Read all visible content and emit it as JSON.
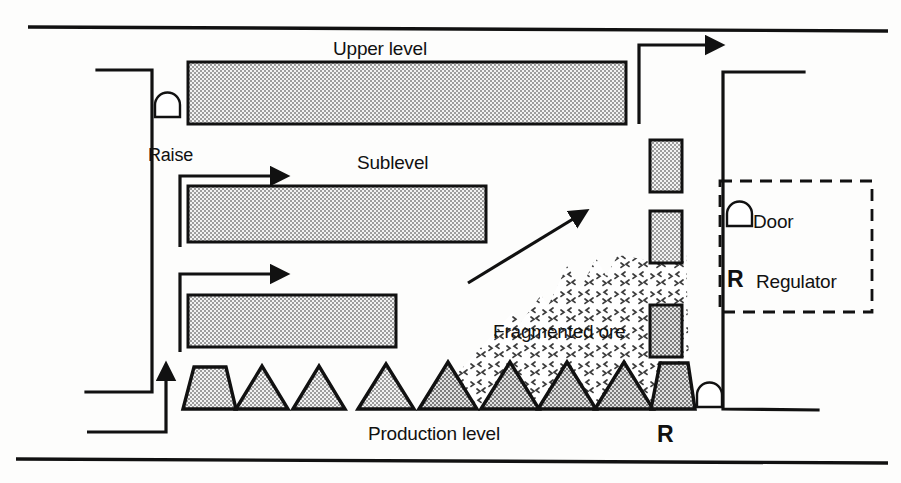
{
  "diagram": {
    "title_implicit": "Sublevel caving mine ventilation schematic",
    "labels": {
      "upper_level": "Upper level",
      "sublevel": "Sublevel",
      "raise": "Raise",
      "fragmented_ore": "Fragmented ore",
      "production_level": "Production level",
      "regulator_marker": "R"
    },
    "legend": {
      "items": [
        {
          "icon": "door-arch-icon",
          "label": "Door"
        },
        {
          "icon": "regulator-letter-icon",
          "glyph": "R",
          "label": "Regulator"
        }
      ]
    },
    "colors": {
      "line": "#111111",
      "hatch_fill": "#9a9a9a",
      "hatch_dark": "#7e7e7e",
      "stipple": "#4a4a4a",
      "background": "#fdfdfc"
    },
    "elements": {
      "drifts": [
        {
          "name": "upper-level-drift",
          "x": 188,
          "y": 62,
          "w": 438,
          "h": 62
        },
        {
          "name": "sublevel-drift-1",
          "x": 188,
          "y": 186,
          "w": 298,
          "h": 56
        },
        {
          "name": "sublevel-drift-2",
          "x": 188,
          "y": 295,
          "w": 208,
          "h": 52
        }
      ],
      "vertical_drifts": [
        {
          "name": "vertical-drift-1",
          "x": 650,
          "y": 140,
          "w": 32,
          "h": 52
        },
        {
          "name": "vertical-drift-2",
          "x": 650,
          "y": 211,
          "w": 32,
          "h": 52
        },
        {
          "name": "vertical-drift-3",
          "x": 650,
          "y": 305,
          "w": 32,
          "h": 52
        }
      ],
      "draw_points": [
        {
          "name": "draw-point-1",
          "shape": "trapezoid",
          "cx": 208
        },
        {
          "name": "draw-point-2",
          "shape": "triangle",
          "cx": 261
        },
        {
          "name": "draw-point-3",
          "shape": "triangle",
          "cx": 318
        },
        {
          "name": "draw-point-4",
          "shape": "triangle",
          "cx": 385
        },
        {
          "name": "draw-point-5",
          "shape": "triangle",
          "cx": 447
        },
        {
          "name": "draw-point-6",
          "shape": "triangle",
          "cx": 509
        },
        {
          "name": "draw-point-7",
          "shape": "triangle",
          "cx": 566
        },
        {
          "name": "draw-point-8",
          "shape": "triangle",
          "cx": 623
        },
        {
          "name": "draw-point-9",
          "shape": "trapezoid",
          "cx": 672
        }
      ],
      "doors": [
        {
          "name": "door-upper-raise",
          "x": 163,
          "y": 104
        },
        {
          "name": "door-production-right",
          "x": 692,
          "y": 392
        }
      ],
      "airflow_arrows": [
        {
          "name": "arrow-sublevel-1",
          "direction": "up-then-right"
        },
        {
          "name": "arrow-sublevel-2",
          "direction": "up-then-right"
        },
        {
          "name": "arrow-production-intake",
          "direction": "right-then-up"
        },
        {
          "name": "arrow-exhaust-top-right",
          "direction": "up-then-right"
        },
        {
          "name": "arrow-caving-diagonal",
          "direction": "up-right-diagonal"
        }
      ]
    }
  }
}
